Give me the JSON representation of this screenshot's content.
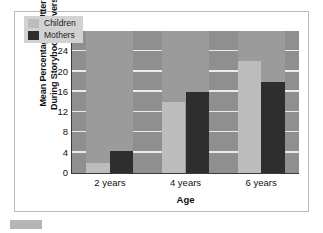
{
  "chart_data": {
    "type": "bar",
    "title": "",
    "subtitle": "",
    "xlabel": "Age",
    "ylabel": "Mean Percentage of Utterances During Storybook Conversations",
    "ylabel_line1": "Mean Percentage of Utterances",
    "ylabel_line2": "During Storybook Conversations",
    "categories": [
      "2 years",
      "4 years",
      "6 years"
    ],
    "series": [
      {
        "name": "Children",
        "color": "#bcbcbc",
        "values": [
          2,
          14,
          22
        ]
      },
      {
        "name": "Mothers",
        "color": "#2e2e2e",
        "values": [
          4.3,
          16,
          18
        ]
      }
    ],
    "ylim": [
      0,
      28
    ],
    "yticks": [
      0,
      4,
      8,
      12,
      16,
      20,
      24,
      28
    ],
    "ytick_labels": [
      "0",
      "4",
      "8",
      "12",
      "16",
      "20",
      "24",
      "28"
    ],
    "grid": true,
    "grid_color": "#ebebeb",
    "legend_position": "top-left",
    "plot_background": "#8f8f8f",
    "figure_background": "#ffffff",
    "axis_color": "#3a3a3a"
  },
  "legend": {
    "items": [
      {
        "label": "Children",
        "color": "#bcbcbc"
      },
      {
        "label": "Mothers",
        "color": "#2e2e2e"
      }
    ]
  },
  "footer": {
    "swatch_color": "#b5b5b5"
  }
}
